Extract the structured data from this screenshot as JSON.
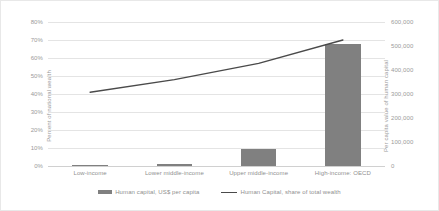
{
  "chart_data": {
    "type": "bar",
    "title": "",
    "subtitle": "",
    "categories": [
      "Low-income",
      "Lower middle-income",
      "Upper middle-income",
      "High-income: OECD"
    ],
    "series": [
      {
        "name": "Human capital, US$ per capita",
        "type": "bar",
        "axis": "right",
        "values": [
          3000,
          8000,
          70000,
          510000
        ],
        "color": "#808080"
      },
      {
        "name": "Human Capital, share of total wealth",
        "type": "line",
        "axis": "left",
        "values": [
          41,
          48,
          57,
          70
        ],
        "color": "#4a4a4a"
      }
    ],
    "xlabel": "",
    "ylabel": "Percent of national wealth",
    "ylabel_right": "Per capita value of human capital",
    "ylim": [
      0,
      80
    ],
    "ylim_right": [
      0,
      600000
    ],
    "yticks": [
      "0%",
      "10%",
      "20%",
      "30%",
      "40%",
      "50%",
      "60%",
      "70%",
      "80%"
    ],
    "ytick_values": [
      0,
      10,
      20,
      30,
      40,
      50,
      60,
      70,
      80
    ],
    "yticks_right": [
      "0",
      "100,000",
      "200,000",
      "300,000",
      "400,000",
      "500,000",
      "600,000"
    ],
    "ytick_values_right": [
      0,
      100000,
      200000,
      300000,
      400000,
      500000,
      600000
    ],
    "grid": true,
    "legend_position": "bottom"
  },
  "axes": {
    "left_title": "Percent of national wealth",
    "right_title": "Per capita value of human capital"
  },
  "legend": {
    "entries": [
      {
        "label": "Human capital, US$ per capita"
      },
      {
        "label": "Human Capital, share of total wealth"
      }
    ]
  }
}
